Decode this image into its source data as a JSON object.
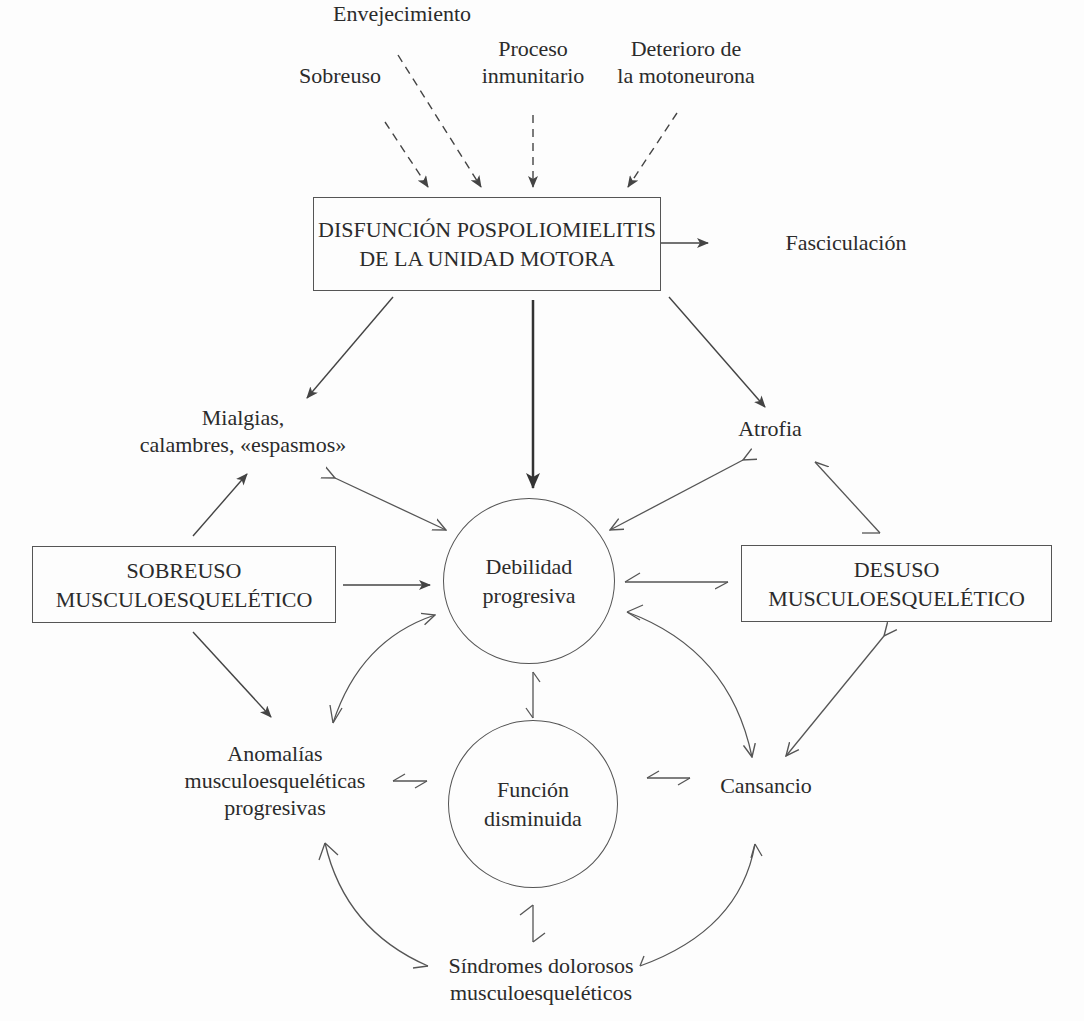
{
  "diagram": {
    "causes": {
      "envejecimiento": "Envejecimiento",
      "proceso": [
        "Proceso",
        "inmunitario"
      ],
      "sobreuso": "Sobreuso",
      "deterioro": [
        "Deterioro de",
        "la motoneurona"
      ]
    },
    "main_box": [
      "DISFUNCIÓN POSPOLIOMIELITIS",
      "DE LA UNIDAD MOTORA"
    ],
    "fasciculacion": "Fasciculación",
    "mialgias": [
      "Mialgias,",
      "calambres, «espasmos»"
    ],
    "atrofia": "Atrofia",
    "sobreuso_box": [
      "SOBREUSO",
      "MUSCULOESQUELÉTICO"
    ],
    "debilidad": [
      "Debilidad",
      "progresiva"
    ],
    "desuso_box": [
      "DESUSO",
      "MUSCULOESQUELÉTICO"
    ],
    "anomalias": [
      "Anomalías",
      "musculoesqueléticas",
      "progresivas"
    ],
    "funcion": [
      "Función",
      "disminuida"
    ],
    "cansancio": "Cansancio",
    "sindromes": [
      "Síndromes dolorosos",
      "musculoesqueléticos"
    ],
    "colors": {
      "line": "#444444",
      "text": "#2b2b2b",
      "background": "#fdfdfd"
    }
  }
}
